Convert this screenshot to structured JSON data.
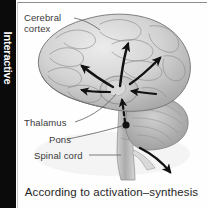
{
  "side_tab": {
    "label": "Interactive"
  },
  "figure": {
    "alt_name": "brain-sagittal-illustration",
    "labels": {
      "cerebral_cortex_line1": "Cerebral",
      "cerebral_cortex_line2": "cortex",
      "thalamus": "Thalamus",
      "pons": "Pons",
      "spinal_cord": "Spinal cord"
    },
    "arrows": {
      "count": 5,
      "description_solid": "solid black arrows radiating from thalamus to cerebral cortex",
      "description_dashed": "dashed black arrow from pons upward to thalamus",
      "description_curved": "curved black arrow leaving the spinal cord toward lower right"
    }
  },
  "caption": {
    "text": "According to activation–synthesis"
  },
  "colors": {
    "tab_background": "#0b0b0b",
    "tab_text": "#ffffff",
    "page_background": "#fefefe",
    "label_text": "#3a3a3a",
    "caption_text": "#262626",
    "rule": "#8d8d8d",
    "brain_light": "#dcdcdc",
    "brain_mid": "#b8b8b8",
    "brain_dark": "#8e8e8e",
    "brain_outline": "#6e6e6e",
    "arrow": "#111111"
  }
}
